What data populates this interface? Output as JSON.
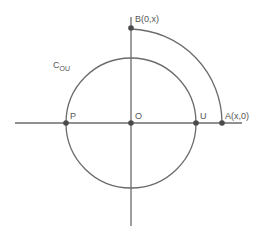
{
  "diagram": {
    "title": "",
    "colors": {
      "stroke": "#6b6b6b",
      "point": "#4a4a4a",
      "text": "#555555"
    },
    "origin": {
      "label": "O",
      "x": 131,
      "y": 123
    },
    "circle": {
      "label_main": "C",
      "label_sub": "OU",
      "radius": 65
    },
    "arc": {
      "radius": 91
    },
    "points": {
      "P": {
        "label": "P"
      },
      "U": {
        "label": "U"
      },
      "A": {
        "label": "A(x,0)"
      },
      "B": {
        "label": "B(0,x)"
      }
    }
  }
}
